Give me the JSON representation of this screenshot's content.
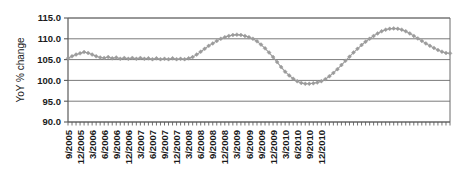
{
  "chart_data": {
    "type": "line",
    "title": "",
    "xlabel": "",
    "ylabel": "YoY % change",
    "ylim": [
      90.0,
      115.0
    ],
    "ytick_labels": [
      "115.0",
      "110.0",
      "105.0",
      "100.0",
      "95.0",
      "90.0"
    ],
    "ytick_values": [
      115.0,
      110.0,
      105.0,
      100.0,
      95.0,
      90.0
    ],
    "grid": true,
    "legend": "none",
    "marker": "diamond",
    "series_color": "#9b9b9b",
    "axis_color": "#5a5a5a",
    "x_tick_labels": [
      "9/2005",
      "12/2005",
      "3/2006",
      "6/2006",
      "9/2006",
      "12/2006",
      "3/2007",
      "6/2007",
      "9/2007",
      "12/2007",
      "3/2008",
      "6/2008",
      "9/2008",
      "12/2008",
      "3/2009",
      "6/2009",
      "9/2009",
      "12/2009",
      "3/2010",
      "6/2010",
      "9/2010",
      "12/2010"
    ],
    "x_labeled_indices": [
      0,
      3,
      6,
      9,
      12,
      15,
      18,
      21,
      24,
      27,
      30,
      33,
      36,
      39,
      42,
      45,
      48,
      51,
      54,
      57,
      60,
      63
    ],
    "x": [
      "9/2005",
      "10/2005",
      "11/2005",
      "12/2005",
      "1/2006",
      "2/2006",
      "3/2006",
      "4/2006",
      "5/2006",
      "6/2006",
      "7/2006",
      "8/2006",
      "9/2006",
      "10/2006",
      "11/2006",
      "12/2006",
      "1/2007",
      "2/2007",
      "3/2007",
      "4/2007",
      "5/2007",
      "6/2007",
      "7/2007",
      "8/2007",
      "9/2007",
      "10/2007",
      "11/2007",
      "12/2007",
      "1/2008",
      "2/2008",
      "3/2008",
      "4/2008",
      "5/2008",
      "6/2008",
      "7/2008",
      "8/2008",
      "9/2008",
      "10/2008",
      "11/2008",
      "12/2008",
      "1/2009",
      "2/2009",
      "3/2009",
      "4/2009",
      "5/2009",
      "6/2009",
      "7/2009",
      "8/2009",
      "9/2009",
      "10/2009",
      "11/2009",
      "12/2009",
      "1/2010",
      "2/2010",
      "3/2010",
      "4/2010",
      "5/2010",
      "6/2010",
      "7/2010",
      "8/2010",
      "9/2010",
      "10/2010",
      "11/2010",
      "12/2010"
    ],
    "values": [
      105.3,
      105.8,
      106.2,
      106.5,
      106.8,
      106.6,
      106.2,
      105.8,
      105.5,
      105.4,
      105.6,
      105.3,
      105.5,
      105.2,
      105.4,
      105.2,
      105.4,
      105.2,
      105.4,
      105.2,
      105.3,
      105.1,
      105.3,
      105.1,
      105.2,
      105.1,
      105.3,
      105.1,
      105.2,
      105.1,
      105.3,
      105.6,
      106.2,
      106.9,
      107.6,
      108.3,
      108.9,
      109.5,
      110.0,
      110.4,
      110.7,
      110.9,
      111.0,
      110.9,
      110.7,
      110.4,
      110.0,
      109.4,
      108.6,
      107.7,
      106.7,
      105.6,
      104.4,
      103.2,
      102.1,
      101.2,
      100.4,
      99.8,
      99.4,
      99.2,
      99.2,
      99.3,
      99.5,
      99.8
    ],
    "values_part2": [
      100.3,
      101.0,
      101.8,
      102.7,
      103.7,
      104.7,
      105.7,
      106.7,
      107.6,
      108.5,
      109.3,
      110.0,
      110.7,
      111.3,
      111.8,
      112.2,
      112.4,
      112.5,
      112.4,
      112.2,
      111.8,
      111.3,
      110.7,
      110.1,
      109.5,
      108.9,
      108.3,
      107.8,
      107.3,
      106.9,
      106.6,
      106.5
    ]
  }
}
